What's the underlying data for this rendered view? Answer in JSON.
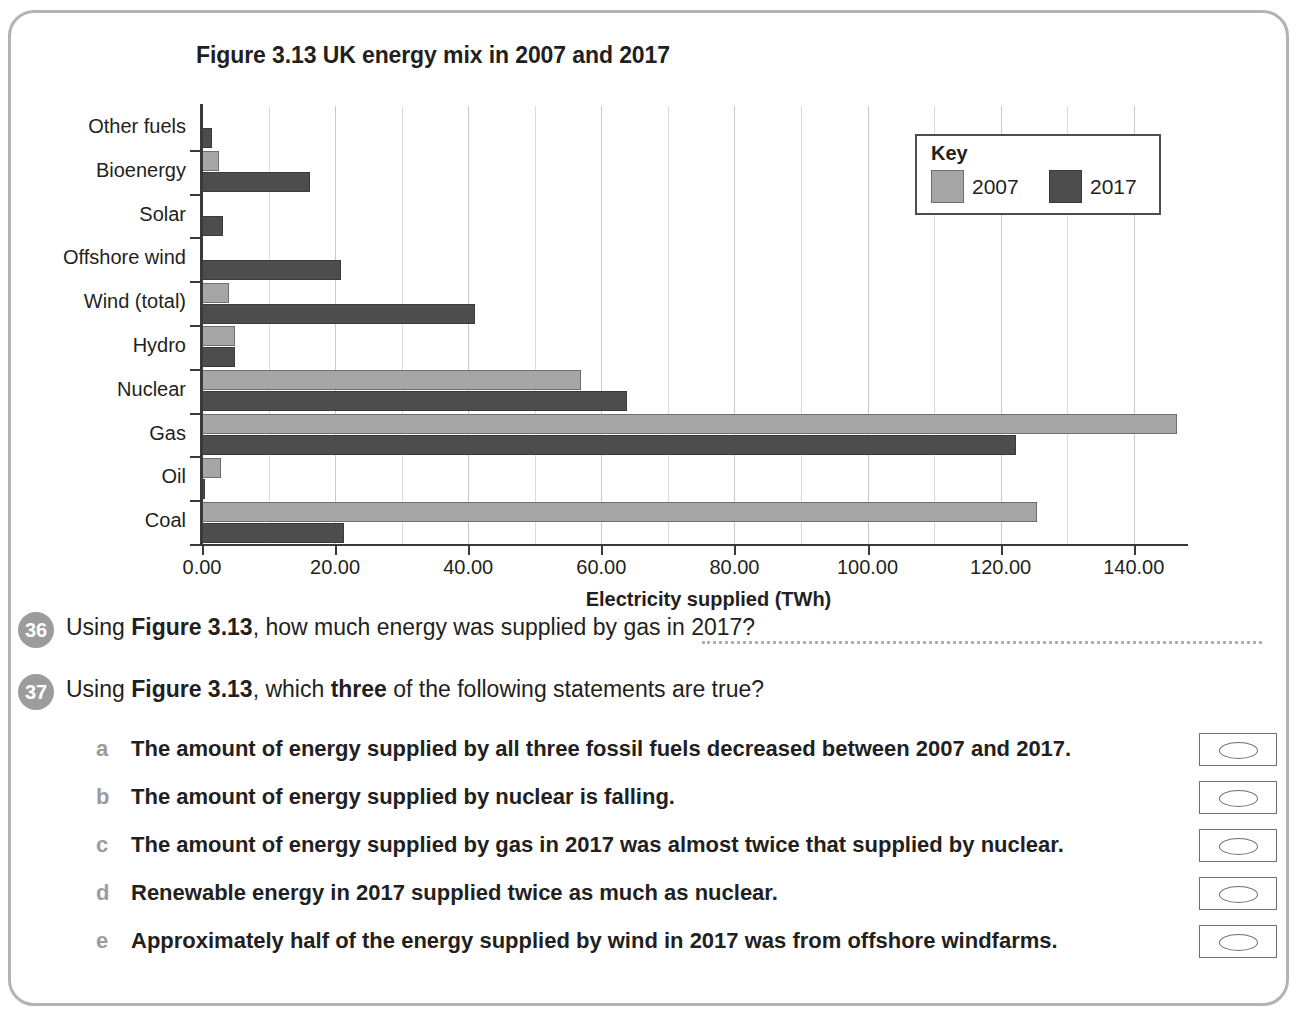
{
  "figure": {
    "title": "Figure 3.13 UK energy mix in 2007 and 2017"
  },
  "legend": {
    "title": "Key",
    "entries": [
      {
        "label": "2007",
        "color": "#a6a6a6"
      },
      {
        "label": "2017",
        "color": "#4d4d4d"
      }
    ]
  },
  "chart_data": {
    "type": "bar",
    "orientation": "horizontal",
    "title": "Figure 3.13 UK energy mix in 2007 and 2017",
    "xlabel": "Electricity supplied (TWh)",
    "ylabel": "",
    "xlim": [
      0,
      148
    ],
    "xticks": [
      0,
      20,
      40,
      60,
      80,
      100,
      120,
      140
    ],
    "xtick_labels": [
      "0.00",
      "20.00",
      "40.00",
      "60.00",
      "80.00",
      "100.00",
      "120.00",
      "140.00"
    ],
    "minor_gridline_step": 10,
    "grid": true,
    "legend_position": "top-right",
    "categories": [
      "Other fuels",
      "Bioenergy",
      "Solar",
      "Offshore wind",
      "Wind (total)",
      "Hydro",
      "Nuclear",
      "Gas",
      "Oil",
      "Coal"
    ],
    "series": [
      {
        "name": "2007",
        "color": "#a6a6a6",
        "values": [
          0,
          2.5,
          0,
          0,
          4.0,
          5.0,
          57.0,
          146.5,
          2.8,
          125.5
        ]
      },
      {
        "name": "2017",
        "color": "#4d4d4d",
        "values": [
          1.5,
          16.3,
          3.2,
          20.9,
          41.0,
          5.0,
          63.8,
          122.3,
          0.5,
          21.3
        ]
      }
    ]
  },
  "questions": [
    {
      "number": "36",
      "text_parts": [
        {
          "t": "Using ",
          "bold": false
        },
        {
          "t": "Figure 3.13",
          "bold": true
        },
        {
          "t": ", how much energy was supplied by gas in 2017?",
          "bold": false
        }
      ],
      "has_answer_line": true
    },
    {
      "number": "37",
      "text_parts": [
        {
          "t": "Using ",
          "bold": false
        },
        {
          "t": "Figure 3.13",
          "bold": true
        },
        {
          "t": ", which ",
          "bold": false
        },
        {
          "t": "three",
          "bold": true
        },
        {
          "t": " of the following statements are true?",
          "bold": false
        }
      ],
      "has_answer_line": false,
      "options": [
        {
          "letter": "a",
          "text": "The amount of energy supplied by all three fossil fuels decreased between 2007 and 2017."
        },
        {
          "letter": "b",
          "text": "The amount of energy supplied by nuclear is falling."
        },
        {
          "letter": "c",
          "text": "The amount of energy supplied by gas in 2017 was almost twice that supplied by nuclear."
        },
        {
          "letter": "d",
          "text": "Renewable energy in 2017 supplied twice as much as nuclear."
        },
        {
          "letter": "e",
          "text": "Approximately half of the energy supplied by wind in 2017 was from offshore windfarms."
        }
      ]
    }
  ]
}
